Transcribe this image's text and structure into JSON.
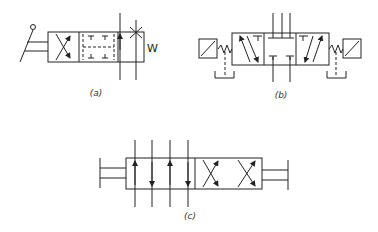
{
  "figure": {
    "type": "hydraulic directional control valve symbols",
    "panels": [
      {
        "id": "a",
        "label": "(a)",
        "description": "3-position valve, manual lever actuation with detent, spring return",
        "side_mark": "W"
      },
      {
        "id": "b",
        "label": "(b)",
        "description": "3-position solenoid-operated valve with springs and pilot drains"
      },
      {
        "id": "c",
        "label": "(c)",
        "description": "4-position valve with mechanical rods on both sides"
      }
    ]
  },
  "colors": {
    "stroke": "#222222",
    "background": "#ffffff"
  }
}
